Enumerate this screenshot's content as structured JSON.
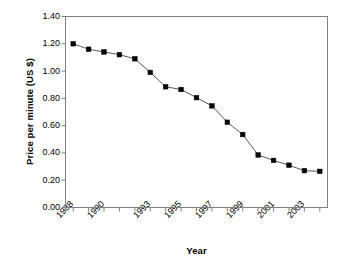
{
  "chart_data": {
    "type": "line",
    "title": "",
    "xlabel": "Year",
    "ylabel": "Price per minute (US $)",
    "x": [
      1988,
      1989,
      1990,
      1991,
      1992,
      1993,
      1994,
      1995,
      1996,
      1997,
      1998,
      1999,
      2000,
      2001,
      2002,
      2003,
      2004
    ],
    "values": [
      1.2,
      1.16,
      1.14,
      1.12,
      1.09,
      0.99,
      0.885,
      0.865,
      0.805,
      0.745,
      0.625,
      0.535,
      0.385,
      0.345,
      0.31,
      0.27,
      0.265
    ],
    "series": [
      {
        "name": "Price per minute",
        "values": [
          1.2,
          1.16,
          1.14,
          1.12,
          1.09,
          0.99,
          0.885,
          0.865,
          0.805,
          0.745,
          0.625,
          0.535,
          0.385,
          0.345,
          0.31,
          0.27,
          0.265
        ]
      }
    ],
    "xlim": [
      1987.5,
      2004.5
    ],
    "ylim": [
      0.0,
      1.4
    ],
    "y_ticks": [
      0.0,
      0.2,
      0.4,
      0.6,
      0.8,
      1.0,
      1.2,
      1.4
    ],
    "y_tick_labels": [
      "0.00",
      "0.20",
      "0.40",
      "0.60",
      "0.80",
      "1.00",
      "1.20",
      "1.40"
    ],
    "x_tick_labels": [
      "1988",
      "1990",
      "1993",
      "1995",
      "1997",
      "1999",
      "2001",
      "2003"
    ],
    "x_tick_label_positions": [
      1988,
      1990,
      1993,
      1995,
      1997,
      1999,
      2001,
      2003
    ],
    "grid": false,
    "legend": null,
    "marker": "square",
    "marker_color": "#000000",
    "line_color": "#595959",
    "axis_color": "#808080",
    "background": "#ffffff"
  }
}
